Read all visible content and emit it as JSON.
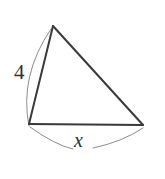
{
  "figure": {
    "kind": "geometry-diagram",
    "shape": "triangle",
    "background_color": "#ffffff",
    "edge_color": "#3a3a3a",
    "arc_color": "#8c8c8c",
    "label_color": "#2f2f2f",
    "edge_width": 2,
    "arc_width": 1,
    "width": 165,
    "height": 179,
    "vertices": [
      {
        "name": "apex",
        "x": 53,
        "y": 26
      },
      {
        "name": "bottom-left",
        "x": 29,
        "y": 124
      },
      {
        "name": "bottom-right",
        "x": 143,
        "y": 125
      }
    ],
    "edges": [
      {
        "name": "left-edge",
        "from": "apex",
        "to": "bottom-left"
      },
      {
        "name": "right-edge",
        "from": "apex",
        "to": "bottom-right"
      },
      {
        "name": "base-edge",
        "from": "bottom-left",
        "to": "bottom-right"
      }
    ],
    "measure_arcs": [
      {
        "name": "left-side-measure-arc",
        "path": "M 51 29 Q 19 76 29 126",
        "for_edge": "left-edge",
        "label": "4"
      },
      {
        "name": "base-measure-arc",
        "path": "M 30 127 Q 86 152 143 128",
        "for_edge": "base-edge",
        "label": "x"
      }
    ],
    "labels": [
      {
        "name": "side-length-4",
        "text": "4",
        "style": "normal",
        "x": 14,
        "y": 62
      },
      {
        "name": "side-length-x",
        "text": "x",
        "style": "italic",
        "x": 74,
        "y": 130
      }
    ]
  }
}
